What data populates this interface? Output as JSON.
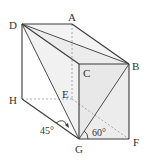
{
  "diagram": {
    "type": "geometry-prism",
    "vertices": {
      "A": {
        "label": "A",
        "x": 72,
        "y": 24
      },
      "B": {
        "label": "B",
        "x": 129,
        "y": 64
      },
      "C": {
        "label": "C",
        "x": 79,
        "y": 64
      },
      "D": {
        "label": "D",
        "x": 22,
        "y": 24
      },
      "E": {
        "label": "E",
        "x": 72,
        "y": 99
      },
      "F": {
        "label": "F",
        "x": 129,
        "y": 139
      },
      "G": {
        "label": "G",
        "x": 79,
        "y": 139
      },
      "H": {
        "label": "H",
        "x": 22,
        "y": 99
      }
    },
    "angles": [
      {
        "label": "45°",
        "at": "G",
        "between": [
          "H",
          "D"
        ]
      },
      {
        "label": "60°",
        "at": "G",
        "between": [
          "F",
          "B"
        ]
      }
    ],
    "colors": {
      "edge": "#3a3a3a",
      "hidden_edge": "#9a9a9a",
      "face_fill": "#eeeeee"
    }
  }
}
